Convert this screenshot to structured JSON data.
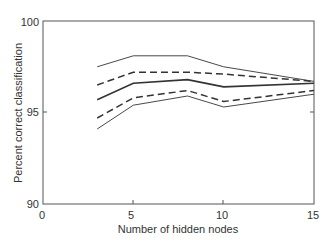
{
  "chart_data": {
    "type": "line",
    "title": "",
    "xlabel": "Number of hidden nodes",
    "ylabel": "Percent correct classification",
    "xlim": [
      0,
      15
    ],
    "ylim": [
      90,
      100
    ],
    "xticks": [
      0,
      5,
      10,
      15
    ],
    "yticks": [
      90,
      95,
      100
    ],
    "grid": false,
    "legend": null,
    "x": [
      3,
      5,
      8,
      10,
      15
    ],
    "series": [
      {
        "name": "upper bound (thin solid)",
        "style": "thin-solid",
        "values": [
          97.5,
          98.1,
          98.1,
          97.5,
          96.7
        ]
      },
      {
        "name": "upper (dashed)",
        "style": "dashed",
        "values": [
          96.5,
          97.2,
          97.2,
          97.1,
          96.7
        ]
      },
      {
        "name": "mean (solid)",
        "style": "solid",
        "values": [
          95.7,
          96.6,
          96.8,
          96.4,
          96.6
        ]
      },
      {
        "name": "lower (dashed)",
        "style": "dashed",
        "values": [
          94.7,
          95.8,
          96.2,
          95.6,
          96.2
        ]
      },
      {
        "name": "lower bound (thin solid)",
        "style": "thin-solid",
        "values": [
          94.1,
          95.4,
          95.9,
          95.3,
          96.0
        ]
      }
    ]
  },
  "labels": {
    "xlabel": "Number of hidden nodes",
    "ylabel": "Percent correct classification",
    "xtick_0": "0",
    "xtick_5": "5",
    "xtick_10": "10",
    "xtick_15": "15",
    "ytick_90": "90",
    "ytick_95": "95",
    "ytick_100": "100"
  }
}
